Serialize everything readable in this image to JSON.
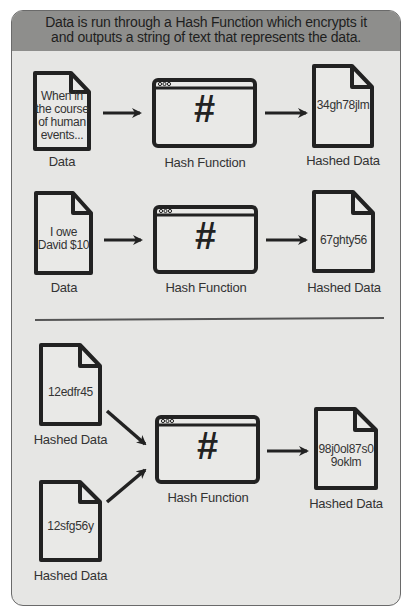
{
  "header": {
    "line1": "Data is run through a Hash Function which encrypts it",
    "line2": "and outputs a string of text that represents the data."
  },
  "example1": {
    "input_doc": {
      "text": [
        "When in",
        "the course",
        "of human",
        "events..."
      ],
      "label": "Data"
    },
    "function": {
      "symbol": "#",
      "label": "Hash Function"
    },
    "output_doc": {
      "text": [
        "34gh78jlm"
      ],
      "label": "Hashed Data"
    }
  },
  "example2": {
    "input_doc": {
      "text": [
        "I owe",
        "David $10"
      ],
      "label": "Data"
    },
    "function": {
      "symbol": "#",
      "label": "Hash Function"
    },
    "output_doc": {
      "text": [
        "67ghty56"
      ],
      "label": "Hashed Data"
    }
  },
  "example3": {
    "input_doc_a": {
      "text": [
        "12edfr45"
      ],
      "label": "Hashed Data"
    },
    "input_doc_b": {
      "text": [
        "12sfg56y"
      ],
      "label": "Hashed Data"
    },
    "function": {
      "symbol": "#",
      "label": "Hash Function"
    },
    "output_doc": {
      "text": [
        "98j0ol87s0",
        "9oklm"
      ],
      "label": "Hashed Data"
    }
  },
  "colors": {
    "header_bg": "#8e8e8c",
    "body_bg": "#e6e6e4",
    "stroke": "#222222"
  }
}
